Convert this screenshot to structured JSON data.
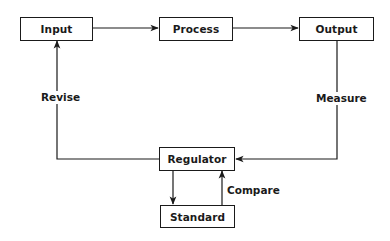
{
  "diagram": {
    "type": "control-loop flowchart",
    "nodes": {
      "input": {
        "label": "Input"
      },
      "process": {
        "label": "Process"
      },
      "output": {
        "label": "Output"
      },
      "regulator": {
        "label": "Regulator"
      },
      "standard": {
        "label": "Standard"
      }
    },
    "edges": [
      {
        "from": "Input",
        "to": "Process",
        "label": ""
      },
      {
        "from": "Process",
        "to": "Output",
        "label": ""
      },
      {
        "from": "Output",
        "to": "Regulator",
        "label": "Measure"
      },
      {
        "from": "Regulator",
        "to": "Input",
        "label": "Revise"
      },
      {
        "from": "Regulator",
        "to": "Standard",
        "label": ""
      },
      {
        "from": "Standard",
        "to": "Regulator",
        "label": "Compare"
      }
    ],
    "edge_labels": {
      "revise": "Revise",
      "measure": "Measure",
      "compare": "Compare"
    },
    "colors": {
      "line": "#1a1a1a",
      "background": "#ffffff"
    }
  }
}
